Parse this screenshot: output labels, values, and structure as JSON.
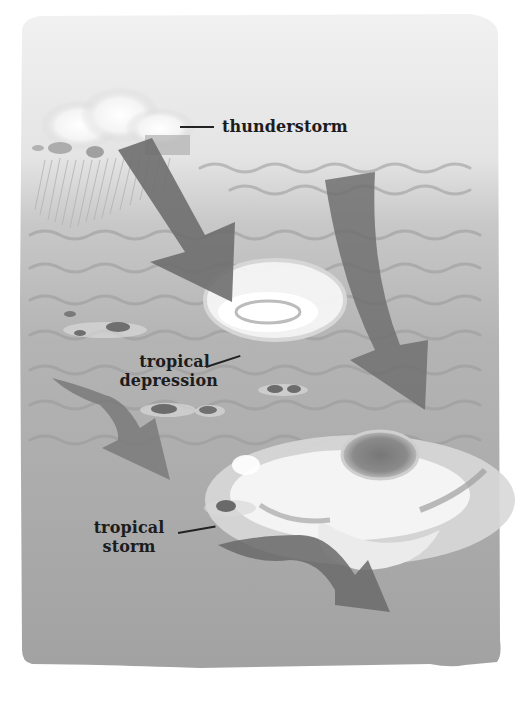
{
  "diagram": {
    "stages": [
      {
        "id": "thunderstorm",
        "label_lines": [
          "thunderstorm"
        ]
      },
      {
        "id": "tropical-depression",
        "label_lines": [
          "tropical",
          "depression"
        ]
      },
      {
        "id": "tropical-storm",
        "label_lines": [
          "tropical",
          "storm"
        ]
      }
    ]
  },
  "labels": {
    "thunderstorm": "thunderstorm",
    "depression_line1": "tropical",
    "depression_line2": "depression",
    "storm_line1": "tropical",
    "storm_line2": "storm"
  },
  "colors": {
    "sky": "#eeeeee",
    "ocean": "#a9a9a9",
    "ocean_deep": "#9c9c9c",
    "wave": "#959595",
    "arrow": "#6f6f6f",
    "cloud": "#f7f7f7",
    "label_text": "#1c1c1c"
  }
}
